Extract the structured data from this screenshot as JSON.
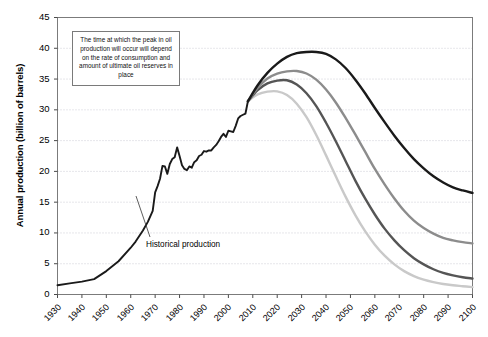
{
  "chart_data": {
    "type": "line",
    "title": "",
    "xlabel": "",
    "ylabel": "Annual production (billion of barrels)",
    "xlim": [
      1930,
      2100
    ],
    "ylim": [
      0,
      45
    ],
    "xticks": [
      1930,
      1940,
      1950,
      1960,
      1970,
      1980,
      1990,
      2000,
      2010,
      2020,
      2030,
      2040,
      2050,
      2060,
      2070,
      2080,
      2090,
      2100
    ],
    "yticks": [
      0,
      5,
      10,
      15,
      20,
      25,
      30,
      35,
      40,
      45
    ],
    "grid": "horizontal-dotted",
    "legend": "none",
    "annotations": [
      {
        "name": "peak-oil-note",
        "text": "The time at which the peak in oil production will occur will depend on the rate of consumption and amount of ultimate oil reserves in place"
      },
      {
        "name": "historical-production-label",
        "text": "Historical production"
      }
    ],
    "series": [
      {
        "name": "Historical production",
        "color": "#1a1a1a",
        "x": [
          1930,
          1935,
          1940,
          1945,
          1950,
          1955,
          1960,
          1962,
          1965,
          1967,
          1969,
          1970,
          1971,
          1972,
          1973,
          1974,
          1975,
          1976,
          1977,
          1978,
          1979,
          1980,
          1981,
          1982,
          1983,
          1984,
          1985,
          1986,
          1987,
          1988,
          1989,
          1990,
          1991,
          1992,
          1993,
          1994,
          1995,
          1996,
          1997,
          1998,
          1999,
          2000,
          2001,
          2002,
          2003,
          2004,
          2005,
          2006,
          2007,
          2008
        ],
        "y": [
          1.5,
          1.8,
          2.1,
          2.5,
          3.8,
          5.4,
          7.6,
          8.6,
          10.4,
          11.8,
          13.6,
          16.6,
          17.6,
          18.8,
          20.9,
          20.8,
          19.6,
          21.2,
          22.0,
          22.3,
          23.9,
          22.5,
          21.0,
          20.4,
          20.2,
          20.8,
          20.6,
          21.5,
          21.8,
          22.5,
          22.7,
          23.3,
          23.2,
          23.4,
          23.4,
          23.9,
          24.3,
          24.9,
          25.6,
          26.1,
          25.6,
          26.6,
          26.5,
          26.4,
          27.4,
          28.6,
          29.0,
          29.2,
          29.4,
          31.4
        ]
      },
      {
        "name": "Low reserves / high consumption scenario",
        "color": "#c9c9c9",
        "peak_year": 2020,
        "peak_value": 33.0,
        "end_year": 2100,
        "end_value": 1.2,
        "x": [
          2008,
          2012,
          2016,
          2020,
          2024,
          2028,
          2032,
          2036,
          2040,
          2044,
          2048,
          2052,
          2056,
          2060,
          2064,
          2068,
          2072,
          2076,
          2080,
          2084,
          2088,
          2092,
          2096,
          2100
        ],
        "y": [
          31.4,
          32.5,
          32.95,
          33.0,
          32.4,
          31.0,
          28.8,
          25.9,
          22.6,
          19.2,
          15.9,
          12.9,
          10.3,
          8.1,
          6.3,
          4.9,
          3.8,
          3.0,
          2.4,
          2.0,
          1.7,
          1.5,
          1.35,
          1.2
        ]
      },
      {
        "name": "Mid-low scenario",
        "color": "#555555",
        "peak_year": 2025,
        "peak_value": 34.8,
        "end_year": 2100,
        "end_value": 2.6,
        "x": [
          2008,
          2012,
          2016,
          2020,
          2024,
          2028,
          2032,
          2036,
          2040,
          2044,
          2048,
          2052,
          2056,
          2060,
          2064,
          2068,
          2072,
          2076,
          2080,
          2084,
          2088,
          2092,
          2096,
          2100
        ],
        "y": [
          31.4,
          33.2,
          34.3,
          34.75,
          34.8,
          34.1,
          32.7,
          30.6,
          27.9,
          24.9,
          21.7,
          18.5,
          15.6,
          13.0,
          10.7,
          8.8,
          7.2,
          5.9,
          4.9,
          4.1,
          3.5,
          3.1,
          2.8,
          2.6
        ]
      },
      {
        "name": "Mid-high scenario",
        "color": "#8c8c8c",
        "peak_year": 2030,
        "peak_value": 36.3,
        "end_year": 2100,
        "end_value": 8.3,
        "x": [
          2008,
          2012,
          2016,
          2020,
          2024,
          2028,
          2032,
          2036,
          2040,
          2044,
          2048,
          2052,
          2056,
          2060,
          2064,
          2068,
          2072,
          2076,
          2080,
          2084,
          2088,
          2092,
          2096,
          2100
        ],
        "y": [
          31.4,
          33.6,
          35.1,
          35.9,
          36.25,
          36.3,
          35.9,
          34.9,
          33.3,
          31.2,
          28.7,
          26.0,
          23.2,
          20.4,
          17.9,
          15.6,
          13.6,
          12.0,
          10.8,
          9.9,
          9.2,
          8.8,
          8.5,
          8.3
        ]
      },
      {
        "name": "High reserves / low consumption scenario",
        "color": "#1a1a1a",
        "peak_year": 2037,
        "peak_value": 39.4,
        "end_year": 2100,
        "end_value": 16.5,
        "x": [
          2008,
          2012,
          2016,
          2020,
          2024,
          2028,
          2032,
          2036,
          2040,
          2044,
          2048,
          2052,
          2056,
          2060,
          2064,
          2068,
          2072,
          2076,
          2080,
          2084,
          2088,
          2092,
          2096,
          2100
        ],
        "y": [
          31.4,
          34.0,
          36.0,
          37.5,
          38.6,
          39.2,
          39.4,
          39.4,
          39.1,
          38.2,
          36.8,
          34.9,
          32.7,
          30.3,
          28.0,
          25.8,
          23.8,
          22.0,
          20.5,
          19.2,
          18.2,
          17.4,
          16.9,
          16.5
        ]
      }
    ]
  }
}
